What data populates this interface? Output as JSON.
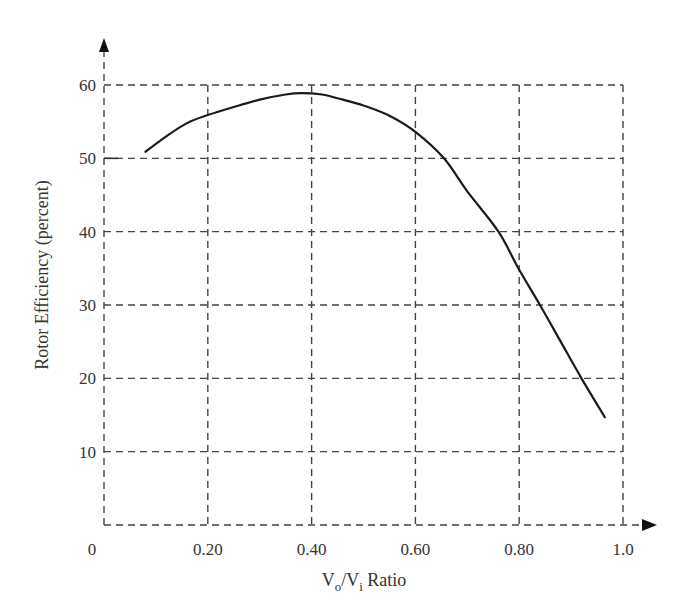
{
  "chart_data": {
    "type": "line",
    "title": "",
    "xlabel": "Vo/Vi Ratio",
    "xlabel_parts": {
      "v1": "V",
      "sub1": "o",
      "slash": "/V",
      "sub2": "i",
      "rest": " Ratio"
    },
    "ylabel": "Rotor Efficiency (percent)",
    "xlim": [
      0,
      1.0
    ],
    "ylim": [
      0,
      60
    ],
    "x_ticks": [
      {
        "value": 0,
        "label": "0"
      },
      {
        "value": 0.2,
        "label": "0.20"
      },
      {
        "value": 0.4,
        "label": "0.40"
      },
      {
        "value": 0.6,
        "label": "0.60"
      },
      {
        "value": 0.8,
        "label": "0.80"
      },
      {
        "value": 1.0,
        "label": "1.0"
      }
    ],
    "y_ticks": [
      {
        "value": 10,
        "label": "10"
      },
      {
        "value": 20,
        "label": "20"
      },
      {
        "value": 30,
        "label": "30"
      },
      {
        "value": 40,
        "label": "40"
      },
      {
        "value": 50,
        "label": "50"
      },
      {
        "value": 60,
        "label": "60"
      }
    ],
    "grid": true,
    "grid_style": "dashed",
    "legend": null,
    "series": [
      {
        "name": "Rotor Efficiency",
        "x": [
          0.08,
          0.12,
          0.16,
          0.2,
          0.25,
          0.3,
          0.35,
          0.38,
          0.42,
          0.46,
          0.5,
          0.55,
          0.6,
          0.655,
          0.7,
          0.76,
          0.8,
          0.84,
          0.88,
          0.92,
          0.965
        ],
        "y": [
          50.9,
          53.0,
          54.8,
          55.9,
          57.0,
          58.0,
          58.7,
          58.9,
          58.7,
          58.0,
          57.2,
          55.8,
          53.6,
          50.0,
          45.5,
          40.0,
          34.8,
          30.0,
          25.0,
          20.0,
          14.7
        ]
      }
    ],
    "annotations": []
  }
}
